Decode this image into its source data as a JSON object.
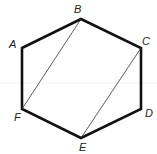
{
  "diagram": {
    "type": "hexagon",
    "colors": {
      "stroke": "#111111",
      "diagonal": "#333333",
      "label": "#222222",
      "background": "#ffffff"
    },
    "vertices": [
      {
        "name": "A",
        "x": 22,
        "y": 48,
        "label_x": 9,
        "label_y": 48
      },
      {
        "name": "B",
        "x": 81,
        "y": 19,
        "label_x": 74,
        "label_y": 13
      },
      {
        "name": "C",
        "x": 141,
        "y": 48,
        "label_x": 142,
        "label_y": 45
      },
      {
        "name": "D",
        "x": 141,
        "y": 109,
        "label_x": 145,
        "label_y": 117
      },
      {
        "name": "E",
        "x": 81,
        "y": 138,
        "label_x": 79,
        "label_y": 151
      },
      {
        "name": "F",
        "x": 22,
        "y": 109,
        "label_x": 14,
        "label_y": 121
      }
    ],
    "edges": [
      "AB",
      "BC",
      "CD",
      "DE",
      "EF",
      "FA"
    ],
    "diagonals": [
      "BF",
      "CE"
    ]
  }
}
